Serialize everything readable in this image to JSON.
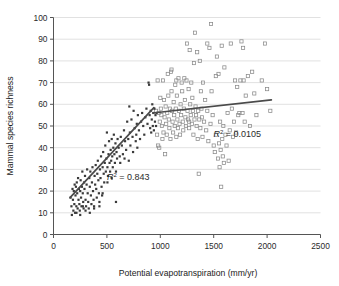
{
  "figure": {
    "name": "mammal-species-richness-vs-pet-scatter",
    "background_color": "#ffffff",
    "gridline_color": "#d9d9d9",
    "axis_color": "#555555",
    "point_fill_color": "#3a3a3a",
    "point_open_color": "#8a8a8a",
    "trendline_color": "#4a4a4a"
  },
  "chart_data": {
    "type": "scatter",
    "title": "",
    "xlabel": "Potential evapotranspiration (mm/yr)",
    "ylabel": "Mammal species richness",
    "xlim": [
      0,
      2500
    ],
    "ylim": [
      0,
      100
    ],
    "xticks": [
      0,
      500,
      1000,
      1500,
      2000,
      2500
    ],
    "yticks": [
      0,
      10,
      20,
      30,
      40,
      50,
      60,
      70,
      80,
      90,
      100
    ],
    "grid": true,
    "grid_axis": "y",
    "legend": false,
    "annotations": [
      {
        "name": "r-squared-left",
        "text": "R2 = 0.843",
        "symbol": "R",
        "superscript": "2",
        "equals": " = ",
        "value": "0.843",
        "x": 700,
        "y": 25
      },
      {
        "name": "r-squared-right",
        "text": "R2 = 0.0105",
        "symbol": "R",
        "superscript": "2",
        "equals": " = ",
        "value": "0.0105",
        "x": 1720,
        "y": 45
      }
    ],
    "trendlines": [
      {
        "name": "low-pet-trendline",
        "r_squared": 0.843,
        "x_start": 155,
        "y_start": 17.0,
        "x_end": 940,
        "y_end": 58.5
      },
      {
        "name": "high-pet-trendline",
        "r_squared": 0.0105,
        "x_start": 930,
        "y_start": 56.0,
        "x_end": 2040,
        "y_end": 62.0
      }
    ],
    "series": [
      {
        "name": "Low PET sites (filled)",
        "marker": "filled-square",
        "color": "#3a3a3a",
        "points": [
          [
            160,
            17
          ],
          [
            168,
            13
          ],
          [
            172,
            9
          ],
          [
            178,
            21
          ],
          [
            182,
            16
          ],
          [
            186,
            11
          ],
          [
            190,
            20
          ],
          [
            195,
            14
          ],
          [
            198,
            23
          ],
          [
            202,
            10
          ],
          [
            206,
            18
          ],
          [
            210,
            22
          ],
          [
            214,
            13
          ],
          [
            218,
            24
          ],
          [
            222,
            19
          ],
          [
            226,
            12
          ],
          [
            230,
            26
          ],
          [
            234,
            16
          ],
          [
            238,
            21
          ],
          [
            242,
            14
          ],
          [
            246,
            11
          ],
          [
            250,
            20
          ],
          [
            254,
            25
          ],
          [
            258,
            17
          ],
          [
            262,
            13
          ],
          [
            266,
            22
          ],
          [
            270,
            29
          ],
          [
            274,
            19
          ],
          [
            278,
            15
          ],
          [
            282,
            12
          ],
          [
            286,
            24
          ],
          [
            290,
            21
          ],
          [
            295,
            27
          ],
          [
            300,
            16
          ],
          [
            305,
            13
          ],
          [
            310,
            23
          ],
          [
            315,
            30
          ],
          [
            320,
            19
          ],
          [
            325,
            15
          ],
          [
            330,
            12
          ],
          [
            335,
            26
          ],
          [
            340,
            22
          ],
          [
            345,
            29
          ],
          [
            350,
            18
          ],
          [
            355,
            14
          ],
          [
            360,
            24
          ],
          [
            365,
            31
          ],
          [
            370,
            20
          ],
          [
            375,
            16
          ],
          [
            380,
            13
          ],
          [
            385,
            27
          ],
          [
            390,
            23
          ],
          [
            395,
            32
          ],
          [
            400,
            21
          ],
          [
            405,
            17
          ],
          [
            410,
            28
          ],
          [
            415,
            34
          ],
          [
            420,
            25
          ],
          [
            425,
            19
          ],
          [
            430,
            15
          ],
          [
            435,
            30
          ],
          [
            440,
            26
          ],
          [
            445,
            36
          ],
          [
            450,
            22
          ],
          [
            455,
            18
          ],
          [
            460,
            31
          ],
          [
            465,
            38
          ],
          [
            470,
            28
          ],
          [
            475,
            24
          ],
          [
            480,
            33
          ],
          [
            485,
            41
          ],
          [
            490,
            29
          ],
          [
            495,
            35
          ],
          [
            500,
            47
          ],
          [
            505,
            31
          ],
          [
            510,
            27
          ],
          [
            515,
            37
          ],
          [
            520,
            43
          ],
          [
            525,
            33
          ],
          [
            530,
            29
          ],
          [
            535,
            39
          ],
          [
            540,
            34
          ],
          [
            545,
            44
          ],
          [
            550,
            36
          ],
          [
            555,
            31
          ],
          [
            560,
            40
          ],
          [
            565,
            46
          ],
          [
            570,
            37
          ],
          [
            575,
            33
          ],
          [
            580,
            42
          ],
          [
            585,
            15
          ],
          [
            590,
            38
          ],
          [
            595,
            35
          ],
          [
            600,
            44
          ],
          [
            610,
            40
          ],
          [
            620,
            36
          ],
          [
            630,
            45
          ],
          [
            640,
            41
          ],
          [
            650,
            37
          ],
          [
            660,
            48
          ],
          [
            670,
            43
          ],
          [
            680,
            39
          ],
          [
            690,
            52
          ],
          [
            700,
            44
          ],
          [
            710,
            59
          ],
          [
            715,
            47
          ],
          [
            720,
            41
          ],
          [
            730,
            53
          ],
          [
            740,
            45
          ],
          [
            750,
            57
          ],
          [
            760,
            49
          ],
          [
            770,
            43
          ],
          [
            775,
            46
          ],
          [
            780,
            51
          ],
          [
            790,
            55
          ],
          [
            800,
            48
          ],
          [
            810,
            44
          ],
          [
            820,
            52
          ],
          [
            830,
            56
          ],
          [
            840,
            50
          ],
          [
            850,
            46
          ],
          [
            860,
            54
          ],
          [
            870,
            58
          ],
          [
            880,
            51
          ],
          [
            890,
            70
          ],
          [
            895,
            69
          ],
          [
            900,
            55
          ],
          [
            905,
            49
          ],
          [
            910,
            57
          ],
          [
            915,
            47
          ],
          [
            920,
            53
          ],
          [
            925,
            60
          ],
          [
            930,
            50
          ],
          [
            935,
            56
          ],
          [
            940,
            48
          ],
          [
            945,
            58
          ],
          [
            950,
            52
          ],
          [
            955,
            55
          ],
          [
            960,
            50
          ],
          [
            965,
            56
          ],
          [
            300,
            11
          ],
          [
            340,
            10
          ],
          [
            250,
            9
          ],
          [
            215,
            10
          ],
          [
            275,
            13
          ],
          [
            430,
            13
          ],
          [
            380,
            12
          ],
          [
            460,
            19
          ],
          [
            505,
            24
          ],
          [
            545,
            26
          ],
          [
            585,
            29
          ],
          [
            625,
            33
          ],
          [
            665,
            35
          ],
          [
            705,
            34
          ],
          [
            745,
            38
          ],
          [
            785,
            40
          ]
        ]
      },
      {
        "name": "High PET sites (open)",
        "marker": "open-square",
        "color": "#8a8a8a",
        "points": [
          [
            960,
            57
          ],
          [
            970,
            46
          ],
          [
            975,
            71
          ],
          [
            980,
            41
          ],
          [
            985,
            56
          ],
          [
            990,
            40
          ],
          [
            995,
            52
          ],
          [
            1000,
            63
          ],
          [
            1005,
            58
          ],
          [
            1010,
            55
          ],
          [
            1015,
            50
          ],
          [
            1020,
            44
          ],
          [
            1025,
            71
          ],
          [
            1030,
            47
          ],
          [
            1035,
            62
          ],
          [
            1040,
            54
          ],
          [
            1045,
            37
          ],
          [
            1050,
            59
          ],
          [
            1055,
            51
          ],
          [
            1060,
            46
          ],
          [
            1065,
            56
          ],
          [
            1070,
            74
          ],
          [
            1075,
            64
          ],
          [
            1080,
            53
          ],
          [
            1085,
            49
          ],
          [
            1090,
            58
          ],
          [
            1095,
            44
          ],
          [
            1100,
            75
          ],
          [
            1105,
            66
          ],
          [
            1110,
            57
          ],
          [
            1115,
            52
          ],
          [
            1120,
            47
          ],
          [
            1125,
            61
          ],
          [
            1130,
            55
          ],
          [
            1135,
            50
          ],
          [
            1140,
            69
          ],
          [
            1145,
            58
          ],
          [
            1150,
            45
          ],
          [
            1155,
            64
          ],
          [
            1160,
            53
          ],
          [
            1165,
            49
          ],
          [
            1170,
            72
          ],
          [
            1175,
            57
          ],
          [
            1180,
            51
          ],
          [
            1185,
            46
          ],
          [
            1190,
            60
          ],
          [
            1195,
            55
          ],
          [
            1200,
            70
          ],
          [
            1205,
            66
          ],
          [
            1210,
            52
          ],
          [
            1215,
            48
          ],
          [
            1220,
            58
          ],
          [
            1225,
            72
          ],
          [
            1230,
            62
          ],
          [
            1235,
            54
          ],
          [
            1240,
            50
          ],
          [
            1245,
            71
          ],
          [
            1250,
            88
          ],
          [
            1255,
            57
          ],
          [
            1260,
            53
          ],
          [
            1265,
            67
          ],
          [
            1270,
            49
          ],
          [
            1275,
            85
          ],
          [
            1280,
            60
          ],
          [
            1285,
            55
          ],
          [
            1290,
            70
          ],
          [
            1295,
            51
          ],
          [
            1300,
            63
          ],
          [
            1305,
            57
          ],
          [
            1310,
            46
          ],
          [
            1315,
            79
          ],
          [
            1320,
            53
          ],
          [
            1325,
            93
          ],
          [
            1330,
            59
          ],
          [
            1335,
            55
          ],
          [
            1340,
            50
          ],
          [
            1345,
            84
          ],
          [
            1350,
            44
          ],
          [
            1355,
            57
          ],
          [
            1360,
            28
          ],
          [
            1365,
            53
          ],
          [
            1370,
            80
          ],
          [
            1375,
            49
          ],
          [
            1380,
            66
          ],
          [
            1385,
            58
          ],
          [
            1390,
            54
          ],
          [
            1395,
            45
          ],
          [
            1400,
            70
          ],
          [
            1410,
            52
          ],
          [
            1420,
            62
          ],
          [
            1430,
            48
          ],
          [
            1440,
            57
          ],
          [
            1450,
            43
          ],
          [
            1460,
            86
          ],
          [
            1470,
            51
          ],
          [
            1475,
            97
          ],
          [
            1480,
            66
          ],
          [
            1490,
            55
          ],
          [
            1500,
            41
          ],
          [
            1510,
            38
          ],
          [
            1520,
            46
          ],
          [
            1530,
            82
          ],
          [
            1540,
            35
          ],
          [
            1545,
            74
          ],
          [
            1550,
            42
          ],
          [
            1555,
            31
          ],
          [
            1560,
            52
          ],
          [
            1565,
            39
          ],
          [
            1570,
            22
          ],
          [
            1575,
            87
          ],
          [
            1580,
            44
          ],
          [
            1585,
            36
          ],
          [
            1590,
            50
          ],
          [
            1595,
            33
          ],
          [
            1600,
            77
          ],
          [
            1610,
            46
          ],
          [
            1620,
            41
          ],
          [
            1630,
            56
          ],
          [
            1640,
            34
          ],
          [
            1650,
            48
          ],
          [
            1660,
            88
          ],
          [
            1670,
            58
          ],
          [
            1680,
            45
          ],
          [
            1690,
            52
          ],
          [
            1700,
            71
          ],
          [
            1710,
            47
          ],
          [
            1720,
            68
          ],
          [
            1730,
            55
          ],
          [
            1740,
            56
          ],
          [
            1750,
            71
          ],
          [
            1760,
            89
          ],
          [
            1770,
            56
          ],
          [
            1775,
            86
          ],
          [
            1780,
            71
          ],
          [
            1790,
            52
          ],
          [
            1800,
            64
          ],
          [
            1820,
            73
          ],
          [
            1840,
            50
          ],
          [
            1860,
            75
          ],
          [
            1880,
            65
          ],
          [
            1900,
            55
          ],
          [
            1950,
            71
          ],
          [
            1980,
            88
          ],
          [
            2000,
            67
          ],
          [
            2030,
            57
          ],
          [
            1105,
            76
          ],
          [
            1440,
            88
          ],
          [
            1520,
            73
          ],
          [
            1150,
            71
          ],
          [
            1270,
            52
          ]
        ]
      }
    ]
  }
}
